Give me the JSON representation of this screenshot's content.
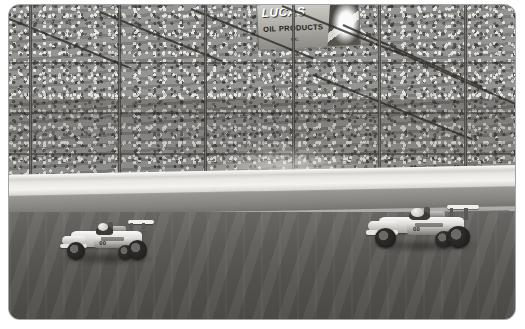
{
  "photo": {
    "alt": "Two IndyCar open-wheel race cars on a speedway oval in front of a packed grandstand",
    "scene_type": "motorsport-photograph",
    "tone": "black-and-white",
    "frame": {
      "border_color": "#ffffff",
      "corner_radius_px": 11,
      "inset_left_px": 9,
      "inset_top_px": 5
    }
  },
  "signage": {
    "banner": {
      "line1": "LUCAS",
      "line2": "OIL PRODUCTS",
      "line3": "INC.",
      "logo_name": "lucas-oil-shield-logo"
    }
  },
  "scene": {
    "grandstand_label": "Packed grandstand",
    "bleachers_label": "Empty upper bleachers",
    "fence_label": "Catch fence poles",
    "wall_label": "White retaining wall",
    "apron_label": "Track apron",
    "track_label": "Asphalt oval track",
    "dust_label": "Tire smoke haze"
  },
  "cars": [
    {
      "id": "car-left",
      "position_label": "Leading car",
      "livery": "white",
      "number": "00",
      "driver_label": "Driver in helmet"
    },
    {
      "id": "car-right",
      "position_label": "Chasing car",
      "livery": "white and dark",
      "number": "00",
      "driver_label": "Driver in helmet"
    }
  ],
  "colors": {
    "track": "#5a5855",
    "wall": "#f1f0ec",
    "crowd": "#8c8c8a",
    "frame": "#ffffff",
    "tire": "#1f1d1b"
  }
}
